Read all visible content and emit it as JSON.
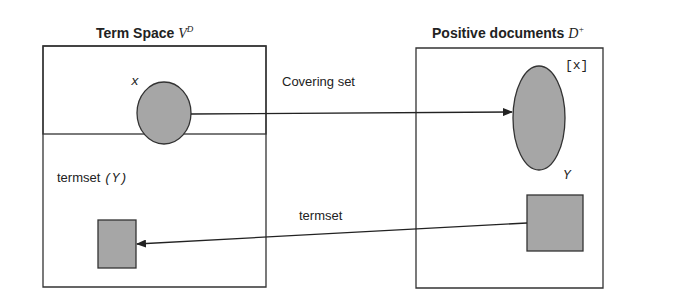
{
  "diagram": {
    "left_panel": {
      "title": "Term Space ",
      "title_symbol": "V",
      "title_symbol_sup": "D",
      "ellipse_label": "x",
      "rect_label_text": "termset ",
      "rect_label_math": "(Y)"
    },
    "right_panel": {
      "title": "Positive documents ",
      "title_symbol": "D",
      "title_symbol_sup": "+",
      "ellipse_label": "[x]",
      "rect_label": "Y"
    },
    "arrows": {
      "top_label": "Covering set",
      "bottom_label": "termset"
    },
    "colors": {
      "shape_fill": "#a6a6a6",
      "stroke": "#333333"
    }
  }
}
